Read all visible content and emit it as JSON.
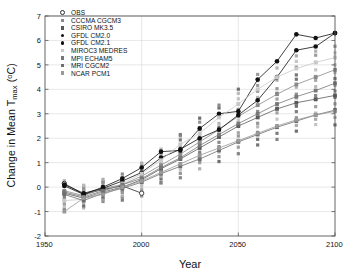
{
  "chart_data": {
    "type": "line",
    "title": "",
    "xlabel": "Year",
    "ylabel": "Change in Mean Tmax (°C)",
    "ylabel_parts": {
      "pre": "Change in Mean T",
      "sub": "max",
      "unit_open": " (",
      "sup": "o",
      "unit_rest": "C)"
    },
    "xlim": [
      1950,
      2100
    ],
    "ylim": [
      -2,
      7
    ],
    "xticks": [
      1950,
      2000,
      2050,
      2100
    ],
    "yticks": [
      -2,
      -1,
      0,
      1,
      2,
      3,
      4,
      5,
      6,
      7
    ],
    "grid": true,
    "grid_color": "#d9d9d9",
    "legend_position": "top-left",
    "x": [
      1960,
      1970,
      1980,
      1990,
      2000,
      2010,
      2020,
      2030,
      2040,
      2050,
      2060,
      2070,
      2080,
      2090,
      2100
    ],
    "series": [
      {
        "name": "OBS",
        "marker": "open-circle",
        "color": "#2b2b2b",
        "x": [
          1960,
          1970,
          1980,
          1990,
          2000
        ],
        "values": [
          0.15,
          -0.3,
          -0.1,
          0.05,
          -0.25
        ]
      },
      {
        "name": "CCCMA CGCM3",
        "marker": "filled-square",
        "color": "#8a8a8a",
        "values": [
          -0.15,
          -0.35,
          -0.05,
          0.1,
          0.45,
          0.9,
          1.35,
          1.85,
          2.35,
          2.9,
          3.35,
          3.8,
          4.2,
          4.5,
          4.8
        ]
      },
      {
        "name": "CSIRO MK3.5",
        "marker": "filled-square",
        "color": "#5a5a5a",
        "values": [
          -0.25,
          -0.45,
          -0.2,
          0.0,
          0.3,
          0.75,
          1.15,
          1.6,
          2.05,
          2.5,
          2.85,
          3.2,
          3.45,
          3.6,
          3.75
        ]
      },
      {
        "name": "GFDL CM2.0",
        "marker": "filled-circle",
        "color": "#111111",
        "values": [
          0.05,
          -0.3,
          0.0,
          0.35,
          0.8,
          1.45,
          1.5,
          2.4,
          3.0,
          3.1,
          4.4,
          5.15,
          6.25,
          6.1,
          6.3
        ]
      },
      {
        "name": "GFDL CM2.1",
        "marker": "filled-circle",
        "color": "#111111",
        "values": [
          0.1,
          -0.25,
          -0.05,
          0.25,
          0.6,
          1.2,
          1.55,
          2.0,
          2.35,
          2.95,
          3.55,
          4.5,
          5.6,
          5.75,
          6.3
        ]
      },
      {
        "name": "MIROC3 MEDRES",
        "marker": "filled-square",
        "color": "#c9c9c9",
        "values": [
          -0.55,
          -0.5,
          -0.2,
          0.15,
          0.55,
          1.1,
          1.75,
          2.2,
          2.85,
          3.4,
          4.0,
          4.5,
          4.85,
          5.1,
          5.3
        ]
      },
      {
        "name": "MPI ECHAM5",
        "marker": "filled-square",
        "color": "#777777",
        "values": [
          -0.2,
          -0.4,
          -0.15,
          0.1,
          0.35,
          0.8,
          1.2,
          1.7,
          2.15,
          2.6,
          3.0,
          3.4,
          3.7,
          3.95,
          4.25
        ]
      },
      {
        "name": "MRI CGCM2",
        "marker": "filled-square",
        "color": "#6d6d6d",
        "values": [
          -0.3,
          -0.55,
          -0.25,
          -0.05,
          0.2,
          0.55,
          0.85,
          1.15,
          1.5,
          1.85,
          2.15,
          2.45,
          2.7,
          2.95,
          3.15
        ]
      },
      {
        "name": "NCAR PCM1",
        "marker": "filled-square",
        "color": "#999999",
        "values": [
          -1.0,
          -0.45,
          -0.3,
          0.0,
          0.25,
          0.6,
          0.95,
          1.3,
          1.6,
          1.9,
          2.2,
          2.5,
          2.75,
          2.95,
          3.1
        ]
      }
    ],
    "spread_points": {
      "note": "vertical scatter of individual runs at each decade",
      "color": "#8f8f8f",
      "x": [
        1960,
        1970,
        1980,
        1990,
        2000,
        2010,
        2020,
        2030,
        2040,
        2050,
        2060,
        2070,
        2080,
        2090,
        2100
      ],
      "ranges": [
        [
          -0.9,
          0.3
        ],
        [
          -0.8,
          0.1
        ],
        [
          -0.6,
          0.3
        ],
        [
          -0.5,
          0.5
        ],
        [
          -0.3,
          1.0
        ],
        [
          0.1,
          1.6
        ],
        [
          0.4,
          2.2
        ],
        [
          0.8,
          2.8
        ],
        [
          1.1,
          3.4
        ],
        [
          1.4,
          4.0
        ],
        [
          1.7,
          4.6
        ],
        [
          2.0,
          5.1
        ],
        [
          2.3,
          5.4
        ],
        [
          2.5,
          5.6
        ],
        [
          2.6,
          5.8
        ]
      ]
    }
  },
  "legend": {
    "items": [
      {
        "label": "OBS",
        "marker": "open-circle",
        "color": "#2b2b2b"
      },
      {
        "label": "CCCMA CGCM3",
        "marker": "filled-square",
        "color": "#8a8a8a"
      },
      {
        "label": "CSIRO MK3.5",
        "marker": "filled-square",
        "color": "#5a5a5a"
      },
      {
        "label": "GFDL CM2.0",
        "marker": "filled-circle",
        "color": "#111111"
      },
      {
        "label": "GFDL CM2.1",
        "marker": "filled-circle",
        "color": "#111111"
      },
      {
        "label": "MIROC3 MEDRES",
        "marker": "filled-square",
        "color": "#c9c9c9"
      },
      {
        "label": "MPI ECHAM5",
        "marker": "filled-square",
        "color": "#777777"
      },
      {
        "label": "MRI CGCM2",
        "marker": "filled-square",
        "color": "#6d6d6d"
      },
      {
        "label": "NCAR PCM1",
        "marker": "filled-square",
        "color": "#999999"
      }
    ]
  },
  "axis_labels": {
    "x_title": "Year",
    "y_pre": "Change in Mean T",
    "y_sub": "max",
    "y_unit": "C)",
    "y_deg": "o",
    "y_paren": " ("
  }
}
